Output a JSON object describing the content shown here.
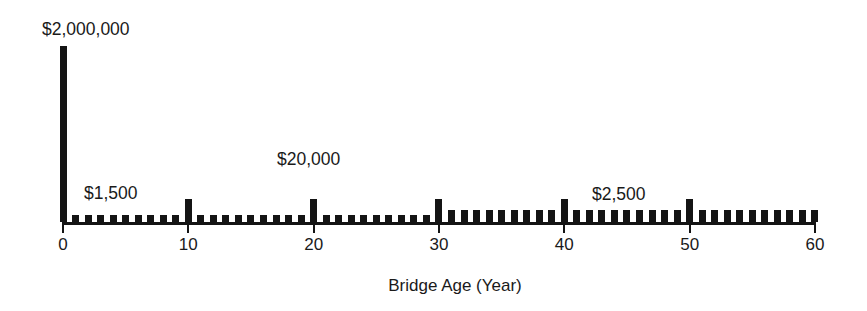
{
  "chart_data": {
    "type": "bar",
    "title": "",
    "subtitle": "",
    "xlabel": "Bridge Age (Year)",
    "ylabel": "",
    "xlim": [
      0,
      60
    ],
    "ylim": [
      0,
      2000000
    ],
    "grid": false,
    "legend": null,
    "x_tick_labels": [
      "0",
      "10",
      "20",
      "30",
      "40",
      "50",
      "60"
    ],
    "x_ticks": [
      0,
      10,
      20,
      30,
      40,
      50,
      60
    ],
    "y_axis_visible": false,
    "y_tick_labels": [],
    "bar_color": "#141414",
    "axis_color": "#141414",
    "background_color": "#ffffff",
    "annotations": [
      {
        "text": "$2,000,000",
        "x": 0,
        "value": 2000000
      },
      {
        "text": "$1,500",
        "x": 3,
        "value": 1500
      },
      {
        "text": "$20,000",
        "x": 20,
        "value": 20000
      },
      {
        "text": "$2,500",
        "x": 45,
        "value": 2500
      }
    ],
    "x": [
      0,
      1,
      2,
      3,
      4,
      5,
      6,
      7,
      8,
      9,
      10,
      11,
      12,
      13,
      14,
      15,
      16,
      17,
      18,
      19,
      20,
      21,
      22,
      23,
      24,
      25,
      26,
      27,
      28,
      29,
      30,
      31,
      32,
      33,
      34,
      35,
      36,
      37,
      38,
      39,
      40,
      41,
      42,
      43,
      44,
      45,
      46,
      47,
      48,
      49,
      50,
      51,
      52,
      53,
      54,
      55,
      56,
      57,
      58,
      59,
      60
    ],
    "values": [
      2000000,
      1500,
      1500,
      1500,
      1500,
      1500,
      1500,
      1500,
      1500,
      1500,
      20000,
      1500,
      1500,
      1500,
      1500,
      1500,
      1500,
      1500,
      1500,
      1500,
      20000,
      1500,
      1500,
      1500,
      1500,
      1500,
      1500,
      1500,
      1500,
      1500,
      20000,
      2500,
      2500,
      2500,
      2500,
      2500,
      2500,
      2500,
      2500,
      2500,
      20000,
      2500,
      2500,
      2500,
      2500,
      2500,
      2500,
      2500,
      2500,
      2500,
      20000,
      2500,
      2500,
      2500,
      2500,
      2500,
      2500,
      2500,
      2500,
      2500,
      2500
    ]
  },
  "geometry": {
    "x_origin_px": 63,
    "x_end_px": 815,
    "baseline_y_px": 222,
    "px_per_year": 12.533,
    "spike_height_px": 176,
    "decade_bar_height_px": 23,
    "low_bar_height_px": 7,
    "mid_bar_height_px": 12,
    "bar_width_px": 7,
    "spike_width_px": 7,
    "tick_len_px": 11,
    "tick_label_y_px": 236,
    "axis_title_y_px": 276,
    "axis_title_x_px": 455,
    "annotation_positions": [
      {
        "text": "$2,000,000",
        "left_px": 42,
        "top_px": 21
      },
      {
        "text": "$1,500",
        "left_px": 84,
        "top_px": 185
      },
      {
        "text": "$20,000",
        "left_px": 277,
        "top_px": 151
      },
      {
        "text": "$2,500",
        "left_px": 592,
        "top_px": 186
      }
    ]
  }
}
